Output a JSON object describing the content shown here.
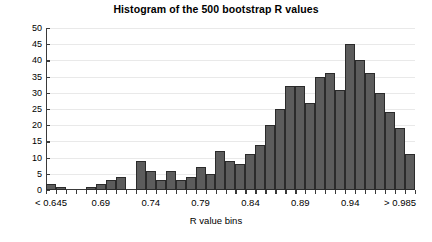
{
  "chart_data": {
    "type": "bar",
    "title": "Histogram of the 500 bootstrap R values",
    "xlabel": "R value bins",
    "ylabel": "Count",
    "ylim": [
      0,
      50
    ],
    "ytick_values": [
      0,
      5,
      10,
      15,
      20,
      25,
      30,
      35,
      40,
      45,
      50
    ],
    "ytick_labels": [
      "0",
      "5",
      "10",
      "15",
      "20",
      "25",
      "30",
      "35",
      "40",
      "45",
      "50"
    ],
    "xtick_labels": [
      "< 0.645",
      "0.69",
      "0.74",
      "0.79",
      "0.84",
      "0.89",
      "0.94",
      "> 0.985"
    ],
    "xtick_positions": [
      0.5,
      5.5,
      10.5,
      15.5,
      20.5,
      25.5,
      30.5,
      35.5
    ],
    "grid": true,
    "legend": "none",
    "bar_color": "#5c5c5c",
    "bar_edge_color": "#2b2b2b",
    "n_bins": 37,
    "values": [
      2,
      1,
      0,
      0,
      1,
      2,
      3,
      4,
      0,
      9,
      6,
      3,
      6,
      3,
      4,
      7,
      5,
      12,
      9,
      8,
      11,
      14,
      20,
      25,
      32,
      32,
      27,
      35,
      36,
      31,
      45,
      40,
      36,
      30,
      24,
      19,
      11
    ],
    "categories": [
      "b1",
      "b2",
      "b3",
      "b4",
      "b5",
      "b6",
      "b7",
      "b8",
      "b9",
      "b10",
      "b11",
      "b12",
      "b13",
      "b14",
      "b15",
      "b16",
      "b17",
      "b18",
      "b19",
      "b20",
      "b21",
      "b22",
      "b23",
      "b24",
      "b25",
      "b26",
      "b27",
      "b28",
      "b29",
      "b30",
      "b31",
      "b32",
      "b33",
      "b34",
      "b35",
      "b36",
      "b37"
    ]
  }
}
